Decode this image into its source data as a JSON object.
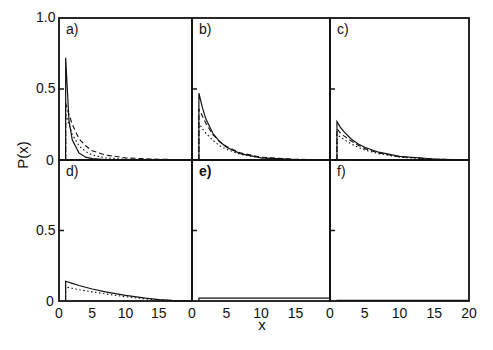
{
  "figure": {
    "ylabel": "P(x)",
    "xlabel": "x",
    "ytick_labels": [
      "1.0",
      "0.5",
      "0"
    ],
    "xtick_labels": [
      "0",
      "5",
      "10",
      "15",
      "20"
    ],
    "panel_labels": [
      "a)",
      "b)",
      "c)",
      "d)",
      "e)",
      "f)"
    ]
  },
  "chart_data": {
    "type": "line",
    "title": "",
    "xlabel": "x",
    "ylabel": "P(x)",
    "layout": "2x3 panel grid with shared axes",
    "xlim": [
      0,
      20
    ],
    "ylim": [
      0,
      1.0
    ],
    "yticks": [
      0,
      0.5,
      1.0
    ],
    "xticks": [
      0,
      5,
      10,
      15,
      20
    ],
    "grid": false,
    "legend": null,
    "line_styles": [
      "solid",
      "dashed",
      "dotted"
    ],
    "panels": [
      {
        "label": "a)",
        "x": [
          1,
          1.5,
          2,
          3,
          4,
          5,
          7,
          10,
          15,
          20
        ],
        "series": [
          {
            "name": "solid",
            "style": "solid",
            "values": [
              0.72,
              0.28,
              0.14,
              0.05,
              0.02,
              0.01,
              0.003,
              0.001,
              0.0,
              0.0
            ]
          },
          {
            "name": "dashed",
            "style": "dashed",
            "values": [
              0.4,
              0.32,
              0.25,
              0.15,
              0.1,
              0.065,
              0.035,
              0.015,
              0.005,
              0.002
            ]
          },
          {
            "name": "dotted",
            "style": "dotted",
            "values": [
              0.33,
              0.25,
              0.18,
              0.1,
              0.06,
              0.035,
              0.015,
              0.005,
              0.001,
              0.0
            ]
          }
        ]
      },
      {
        "label": "b)",
        "x": [
          1,
          1.5,
          2,
          3,
          4,
          5,
          7,
          10,
          15,
          20
        ],
        "series": [
          {
            "name": "solid",
            "style": "solid",
            "values": [
              0.47,
              0.37,
              0.29,
              0.19,
              0.13,
              0.09,
              0.045,
              0.015,
              0.003,
              0.0
            ]
          },
          {
            "name": "dashed",
            "style": "dashed",
            "values": [
              0.36,
              0.31,
              0.26,
              0.18,
              0.13,
              0.095,
              0.05,
              0.02,
              0.005,
              0.001
            ]
          },
          {
            "name": "dotted",
            "style": "dotted",
            "values": [
              0.26,
              0.22,
              0.19,
              0.14,
              0.1,
              0.075,
              0.04,
              0.015,
              0.003,
              0.0
            ]
          }
        ]
      },
      {
        "label": "c)",
        "x": [
          1,
          1.5,
          2,
          3,
          4,
          5,
          7,
          10,
          15,
          20
        ],
        "series": [
          {
            "name": "solid",
            "style": "solid",
            "values": [
              0.27,
              0.23,
              0.2,
              0.15,
              0.115,
              0.09,
              0.055,
              0.025,
              0.007,
              0.0
            ]
          },
          {
            "name": "dashed",
            "style": "dashed",
            "values": [
              0.22,
              0.19,
              0.17,
              0.135,
              0.105,
              0.08,
              0.05,
              0.023,
              0.006,
              0.0
            ]
          },
          {
            "name": "dotted",
            "style": "dotted",
            "values": [
              0.18,
              0.16,
              0.145,
              0.115,
              0.09,
              0.07,
              0.045,
              0.02,
              0.005,
              0.0
            ]
          }
        ]
      },
      {
        "label": "d)",
        "x": [
          1,
          2,
          3,
          5,
          7,
          10,
          13,
          15,
          17,
          20
        ],
        "series": [
          {
            "name": "solid",
            "style": "solid",
            "values": [
              0.14,
              0.125,
              0.11,
              0.085,
              0.065,
              0.04,
              0.02,
              0.01,
              0.004,
              0.0
            ]
          },
          {
            "name": "dotted",
            "style": "dotted",
            "values": [
              0.1,
              0.09,
              0.08,
              0.065,
              0.05,
              0.03,
              0.015,
              0.008,
              0.003,
              0.0
            ]
          }
        ]
      },
      {
        "label": "e)",
        "x": [
          1,
          20
        ],
        "series": [
          {
            "name": "solid",
            "style": "solid",
            "values": [
              0.02,
              0.02
            ]
          }
        ]
      },
      {
        "label": "f)",
        "x": [
          1,
          20
        ],
        "series": [
          {
            "name": "solid",
            "style": "solid",
            "values": [
              0.005,
              0.005
            ]
          }
        ]
      }
    ]
  }
}
